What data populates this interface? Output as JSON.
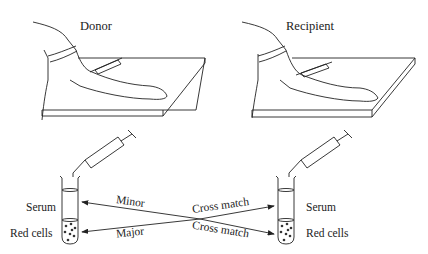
{
  "panels": {
    "donor": {
      "title": "Donor"
    },
    "recipient": {
      "title": "Recipient"
    }
  },
  "tubes": {
    "left": {
      "top_label": "Serum",
      "bottom_label": "Red cells"
    },
    "right": {
      "top_label": "Serum",
      "bottom_label": "Red cells"
    }
  },
  "arrows": {
    "minor": "Minor",
    "major": "Major",
    "cross_match_top": "Cross match",
    "cross_match_bottom": "Cross match"
  },
  "colors": {
    "ink": "#222222",
    "background": "#ffffff"
  }
}
